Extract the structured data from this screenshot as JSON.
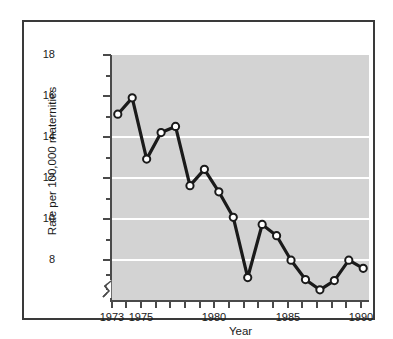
{
  "chart_data": {
    "type": "line",
    "title": "",
    "xlabel": "Year",
    "ylabel": "Rate per 100,000 maternities",
    "x": [
      1973,
      1974,
      1975,
      1976,
      1977,
      1978,
      1979,
      1980,
      1981,
      1982,
      1983,
      1984,
      1985,
      1986,
      1987,
      1988,
      1989,
      1990
    ],
    "values": [
      15.1,
      15.9,
      12.9,
      14.2,
      14.5,
      11.6,
      12.4,
      11.3,
      10.05,
      7.1,
      9.7,
      9.15,
      7.95,
      7.0,
      6.5,
      6.95,
      7.95,
      7.55
    ],
    "series": [
      {
        "name": "Rate per 100,000 maternities",
        "values": [
          15.1,
          15.9,
          12.9,
          14.2,
          14.5,
          11.6,
          12.4,
          11.3,
          10.05,
          7.1,
          9.7,
          9.15,
          7.95,
          7.0,
          6.5,
          6.95,
          7.95,
          7.55
        ]
      }
    ],
    "xlim": [
      1972.6,
      1990.4
    ],
    "ylim": [
      6.0,
      18.0
    ],
    "y_axis_break": true,
    "y_axis_break_below": 7.4,
    "ytick_labels": [
      "18",
      "16",
      "14",
      "12",
      "10",
      "8"
    ],
    "ytick_values": [
      18,
      16,
      14,
      12,
      10,
      8
    ],
    "yminor_tick_values": [
      17,
      15,
      13,
      11,
      9,
      7
    ],
    "xtick_labels": [
      "1973",
      "1975",
      "1980",
      "1985",
      "1990"
    ],
    "xtick_values": [
      1973,
      1975,
      1980,
      1985,
      1990
    ],
    "xminor_tick_values": [
      1974,
      1976,
      1977,
      1978,
      1979,
      1981,
      1982,
      1983,
      1984,
      1986,
      1987,
      1988,
      1989
    ],
    "grid": "horizontal",
    "gridline_values": [
      16,
      14,
      12,
      10,
      8
    ],
    "legend": "none",
    "marker": "open-circle",
    "colors": {
      "plot_background": "#d3d3d3",
      "figure_background": "#ffffff",
      "gridline": "#ffffff",
      "line": "#1a1a1a",
      "marker_face": "#ffffff",
      "marker_edge": "#1a1a1a",
      "axis": "#4a4a4a",
      "frame_border": "#3a3a3a",
      "text": "#1a1a1a"
    }
  }
}
